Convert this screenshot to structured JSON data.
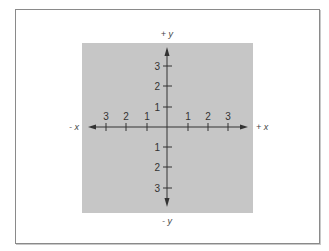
{
  "diagram": {
    "colors": {
      "panel": "#c6c6c6",
      "axis": "#333333",
      "frame": "#8a8a8a",
      "background": "#ffffff"
    },
    "axis_labels": {
      "pos_y": "+ y",
      "neg_y": "- y",
      "pos_x": "+ x",
      "neg_x": "- x"
    },
    "x_ticks": [
      {
        "label": "3",
        "x": 106
      },
      {
        "label": "2",
        "x": 126
      },
      {
        "label": "1",
        "x": 147
      },
      {
        "label": "1",
        "x": 188
      },
      {
        "label": "2",
        "x": 208
      },
      {
        "label": "3",
        "x": 228
      }
    ],
    "y_ticks": [
      {
        "label": "3",
        "y": 66
      },
      {
        "label": "2",
        "y": 86
      },
      {
        "label": "1",
        "y": 107
      },
      {
        "label": "1",
        "y": 147
      },
      {
        "label": "2",
        "y": 167
      },
      {
        "label": "3",
        "y": 188
      }
    ]
  }
}
